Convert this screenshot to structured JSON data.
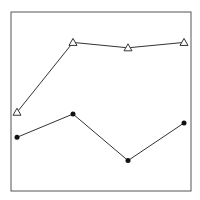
{
  "chart_data": {
    "type": "line",
    "title": "",
    "xlabel": "",
    "ylabel": "",
    "categories": [
      "1",
      "2",
      "3",
      "4"
    ],
    "series": [
      {
        "name": "triangles",
        "marker": "open-triangle",
        "values": [
          0.44,
          0.83,
          0.8,
          0.83
        ]
      },
      {
        "name": "circles",
        "marker": "filled-circle",
        "values": [
          0.3,
          0.43,
          0.17,
          0.38
        ]
      }
    ],
    "ylim": [
      0,
      1
    ],
    "grid": false,
    "legend": "none",
    "colors": {
      "line": "#333333",
      "frame": "#555555"
    }
  }
}
